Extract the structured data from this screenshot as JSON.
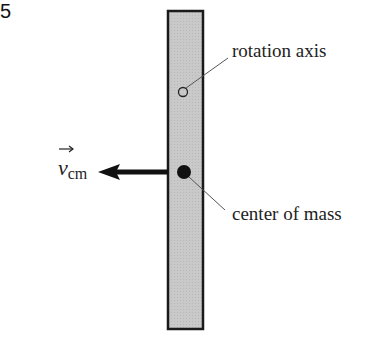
{
  "figure": {
    "number": "5",
    "labels": {
      "rotation_axis": "rotation axis",
      "center_of_mass": "center of mass",
      "velocity_symbol": "v",
      "velocity_subscript": "cm"
    },
    "colors": {
      "rod_fill": "#c8c8c8",
      "rod_stroke": "#1a1a1a",
      "arrow": "#111111",
      "leader_line": "#555555"
    }
  }
}
